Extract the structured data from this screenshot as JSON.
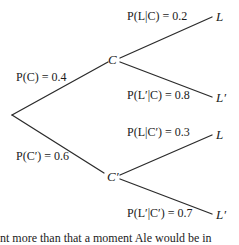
{
  "diagram": {
    "type": "probability-tree",
    "root": {
      "label": ""
    },
    "branches": [
      {
        "node": "C",
        "probability_label": "P(C) = 0.4",
        "children": [
          {
            "leaf": "L",
            "probability_label": "P(L|C) = 0.2"
          },
          {
            "leaf": "L′",
            "probability_label": "P(L′|C) = 0.8"
          }
        ]
      },
      {
        "node": "C′",
        "probability_label": "P(C′) = 0.6",
        "children": [
          {
            "leaf": "L",
            "probability_label": "P(L|C′) = 0.3"
          },
          {
            "leaf": "L′",
            "probability_label": "P(L′|C′) = 0.7"
          }
        ]
      }
    ],
    "line_color": "#2b2b2b"
  },
  "footer": {
    "clipped_text": "nt more than that a moment Ale would be in"
  }
}
